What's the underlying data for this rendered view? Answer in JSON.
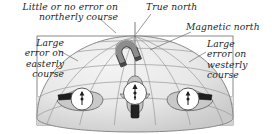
{
  "figure": {
    "name": "magnetic-compass-turning-error-diagram",
    "background_color": "#ffffff",
    "text_color": "#221f1f",
    "dome_fill": "#e9e9e9",
    "dome_edge": "#8a8a8a",
    "grid_color": "#9a9a9a",
    "base_fill": "#dcdcdc",
    "compass_face": "#ffffff",
    "aircraft_color": "#1d1d1d",
    "magnet_color": "#7d7d7d",
    "leader_color": "#6f6f6f"
  },
  "labels": {
    "northerly": "Little or no error on\nnortherly course",
    "easterly": "Large\nerror on\neasterly\ncourse",
    "westerly": "Large\nerror on\nwesterly\ncourse",
    "true_north": "True north",
    "magnetic_north": "Magnetic north"
  },
  "icons": {
    "magnet": "horseshoe-magnet-icon",
    "compass": "compass-rose-icon",
    "aircraft": "aircraft-icon",
    "globe": "globe-dome-icon"
  },
  "elements": {
    "compass_north": "compass-northerly-course",
    "compass_east": "compass-easterly-course",
    "compass_west": "compass-westerly-course"
  }
}
